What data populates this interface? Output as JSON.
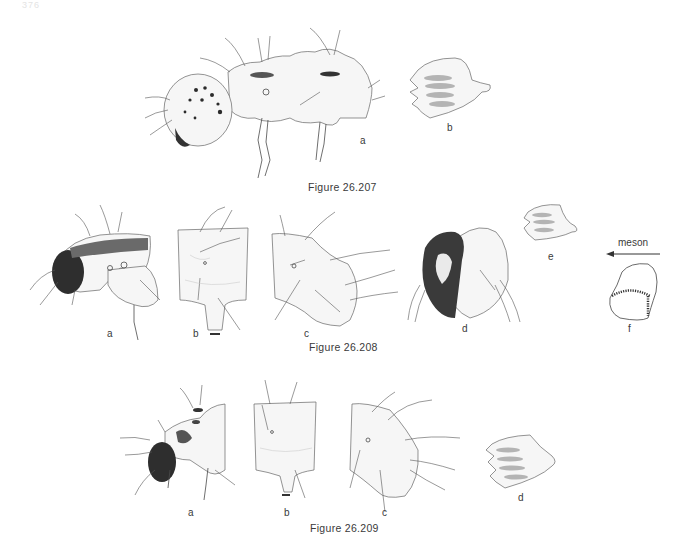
{
  "page": {
    "page_number": "376"
  },
  "figures": [
    {
      "caption": "Figure 26.207",
      "panels": [
        {
          "label": "a",
          "description": "larva lateral view, head and thorax"
        },
        {
          "label": "b",
          "description": "mandible / sclerite outline with shaded ridges"
        }
      ]
    },
    {
      "caption": "Figure 26.208",
      "panels": [
        {
          "label": "a",
          "description": "larva lateral view, head and thorax"
        },
        {
          "label": "b",
          "description": "segment dorsal view"
        },
        {
          "label": "c",
          "description": "segment lateral view"
        },
        {
          "label": "d",
          "description": "head capsule, patterned"
        },
        {
          "label": "e",
          "description": "sclerite outline with shaded ridges"
        },
        {
          "label": "f",
          "description": "sclerite with radiating striae"
        }
      ],
      "annotation": {
        "text": "meson",
        "arrow": "left"
      }
    },
    {
      "caption": "Figure 26.209",
      "panels": [
        {
          "label": "a",
          "description": "larva lateral view, head and thorax"
        },
        {
          "label": "b",
          "description": "segment dorsal view"
        },
        {
          "label": "c",
          "description": "segment lateral view"
        },
        {
          "label": "d",
          "description": "sclerite outline with shaded ridges"
        }
      ]
    }
  ]
}
